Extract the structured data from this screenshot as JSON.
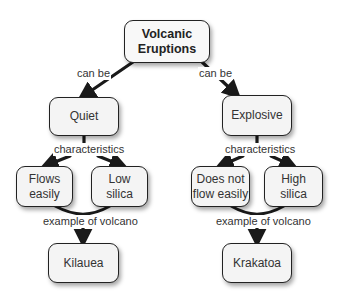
{
  "diagram": {
    "type": "concept-map",
    "root": {
      "id": "volcanic-eruptions",
      "lines": [
        "Volcanic",
        "Eruptions"
      ]
    },
    "branches": [
      {
        "id": "quiet",
        "link_label": "can be",
        "node": {
          "lines": [
            "Quiet"
          ]
        },
        "characteristics_label": "characteristics",
        "characteristics": [
          {
            "id": "flows-easily",
            "lines": [
              "Flows",
              "easily"
            ]
          },
          {
            "id": "low-silica",
            "lines": [
              "Low",
              "silica"
            ]
          }
        ],
        "example_label": "example of volcano",
        "example": {
          "id": "kilauea",
          "lines": [
            "Kilauea"
          ]
        }
      },
      {
        "id": "explosive",
        "link_label": "can be",
        "node": {
          "lines": [
            "Explosive"
          ]
        },
        "characteristics_label": "characteristics",
        "characteristics": [
          {
            "id": "does-not-flow-easily",
            "lines": [
              "Does not",
              "flow easily"
            ]
          },
          {
            "id": "high-silica",
            "lines": [
              "High",
              "silica"
            ]
          }
        ],
        "example_label": "example of volcano",
        "example": {
          "id": "krakatoa",
          "lines": [
            "Krakatoa"
          ]
        }
      }
    ]
  },
  "colors": {
    "node_fill": "#f4f4f4",
    "node_border": "#222222",
    "arrow": "#1a1a1a",
    "text": "#333333"
  }
}
